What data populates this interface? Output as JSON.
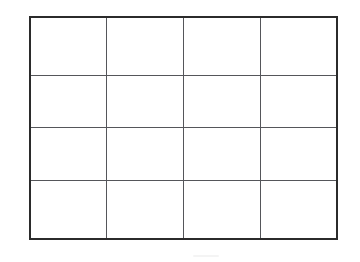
{
  "document": {
    "kind": "scanned-blank-grid",
    "background_color": "#ffffff",
    "border_color": "#2b2b2b",
    "gridline_color": "#55565a"
  },
  "table": {
    "rows": 4,
    "columns": 4,
    "cells": [
      [
        "",
        "",
        "",
        ""
      ],
      [
        "",
        "",
        "",
        ""
      ],
      [
        "",
        "",
        "",
        ""
      ],
      [
        "",
        "",
        "",
        ""
      ]
    ]
  }
}
